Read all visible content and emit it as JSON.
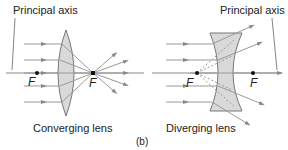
{
  "figure_label": "(b)",
  "converging": {
    "title": "Converging lens",
    "axis_label": "Principal axis",
    "focal_left": "F",
    "focal_right": "F"
  },
  "diverging": {
    "title": "Diverging lens",
    "axis_label": "Principal axis",
    "focal_left": "F",
    "focal_right": "F"
  },
  "colors": {
    "ray": "#888888",
    "lens_fill": "#d9d9d9",
    "lens_stroke": "#777777",
    "axis": "#777777",
    "focal_point": "#111111"
  }
}
